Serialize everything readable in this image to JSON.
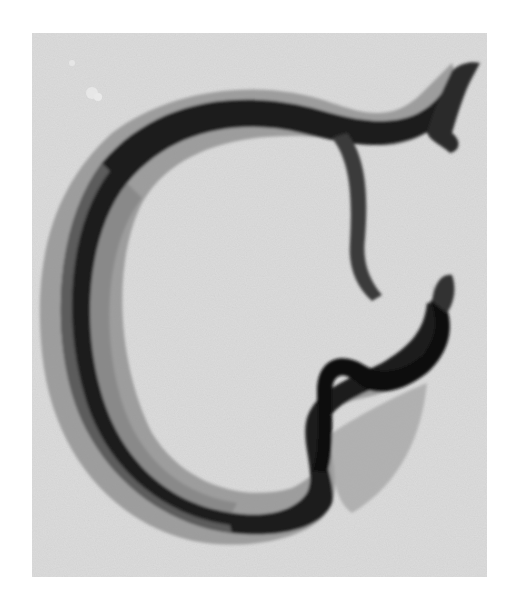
{
  "figure": {
    "type": "grayscale micrograph",
    "colors": {
      "page_background": "#ffffff",
      "plate_background": "#dcdcdc",
      "body_dark": "#151515",
      "body_mid": "#5a5a5a",
      "body_light": "#a8a8a8"
    }
  }
}
